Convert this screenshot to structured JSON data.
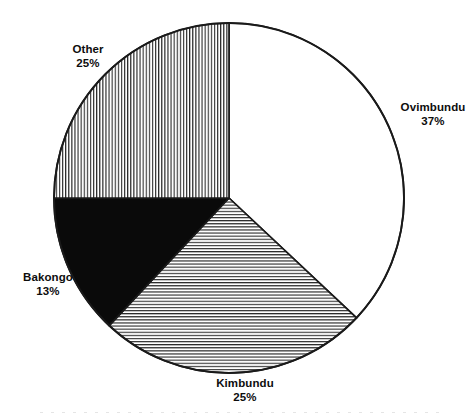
{
  "chart_data": {
    "type": "pie",
    "title": "",
    "subtitle": "",
    "xlabel": "",
    "ylabel": "",
    "legend_position": "none",
    "grid": false,
    "labels_inline": true,
    "total_percent": 100,
    "start_angle_deg": 0,
    "direction": "clockwise",
    "categories": [
      "Ovimbundu",
      "Kimbundu",
      "Bakongo",
      "Other"
    ],
    "values": [
      37,
      25,
      13,
      25
    ],
    "slices": [
      {
        "name": "Ovimbundu",
        "value": 37,
        "label": "Ovimbundu",
        "value_label": "37%",
        "fill": "white",
        "fill_color": "#ffffff",
        "stroke_color": "#1a1a1a",
        "start_deg": 0,
        "end_deg": 133.2
      },
      {
        "name": "Kimbundu",
        "value": 25,
        "label": "Kimbundu",
        "value_label": "25%",
        "fill": "horizontal-hatch",
        "fill_color": "#ffffff",
        "stroke_color": "#1a1a1a",
        "start_deg": 133.2,
        "end_deg": 223.2
      },
      {
        "name": "Bakongo",
        "value": 13,
        "label": "Bakongo",
        "value_label": "13%",
        "fill": "solid-black",
        "fill_color": "#0a0a0a",
        "stroke_color": "#1a1a1a",
        "start_deg": 223.2,
        "end_deg": 270.0
      },
      {
        "name": "Other",
        "value": 25,
        "label": "Other",
        "value_label": "25%",
        "fill": "vertical-hatch",
        "fill_color": "#ffffff",
        "stroke_color": "#1a1a1a",
        "start_deg": 270.0,
        "end_deg": 360.0
      }
    ]
  },
  "figure": {
    "background_color": "#ffffff",
    "outline_color": "#1a1a1a",
    "text_color": "#0d0d0d",
    "center_x": 229,
    "center_y": 198,
    "radius": 175
  }
}
